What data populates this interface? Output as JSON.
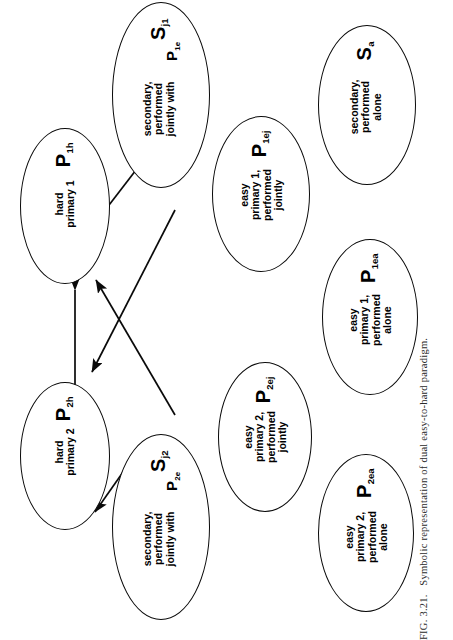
{
  "figure": {
    "caption_label": "FIG. 3.21.",
    "caption_text": "Symbolic representation of dual easy-to-hard paradigm.",
    "line_color": "#0a0a0a",
    "background_color": "#ffffff"
  },
  "nodes": {
    "p2h": {
      "symbol": "P",
      "subscript": "2h",
      "description": "hard\nprimary 2"
    },
    "p1h": {
      "symbol": "P",
      "subscript": "1h",
      "description": "hard\nprimary 1"
    },
    "sj2": {
      "symbol": "S",
      "subscript": "j2",
      "description": "secondary,\nperformed\njointly with",
      "trailer_symbol": "P",
      "trailer_subscript": "2e"
    },
    "sj1": {
      "symbol": "S",
      "subscript": "j1",
      "description": "secondary,\nperformed\njointly with",
      "trailer_symbol": "P",
      "trailer_subscript": "1e"
    },
    "p2ej": {
      "symbol": "P",
      "subscript": "2ej",
      "description": "easy\nprimary 2,\nperformed\njointly"
    },
    "p1ej": {
      "symbol": "P",
      "subscript": "1ej",
      "description": "easy\nprimary 1,\nperformed\njointly"
    },
    "p2ea": {
      "symbol": "P",
      "subscript": "2ea",
      "description": "easy\nprimary 2,\nperformed\nalone"
    },
    "p1ea": {
      "symbol": "P",
      "subscript": "1ea",
      "description": "easy\nprimary 1,\nperformed\nalone"
    },
    "sa": {
      "symbol": "S",
      "subscript": "a",
      "description": "secondary,\nperformed\nalone"
    }
  },
  "edges": [
    {
      "from": "p2h",
      "to": "p1h",
      "type": "double-arrow"
    },
    {
      "from": "sj2",
      "to": "p2h",
      "type": "arrow"
    },
    {
      "from": "sj2",
      "to": "p1h",
      "type": "arrow"
    },
    {
      "from": "sj1",
      "to": "p1h",
      "type": "arrow"
    },
    {
      "from": "sj1",
      "to": "p2h",
      "type": "arrow"
    }
  ]
}
